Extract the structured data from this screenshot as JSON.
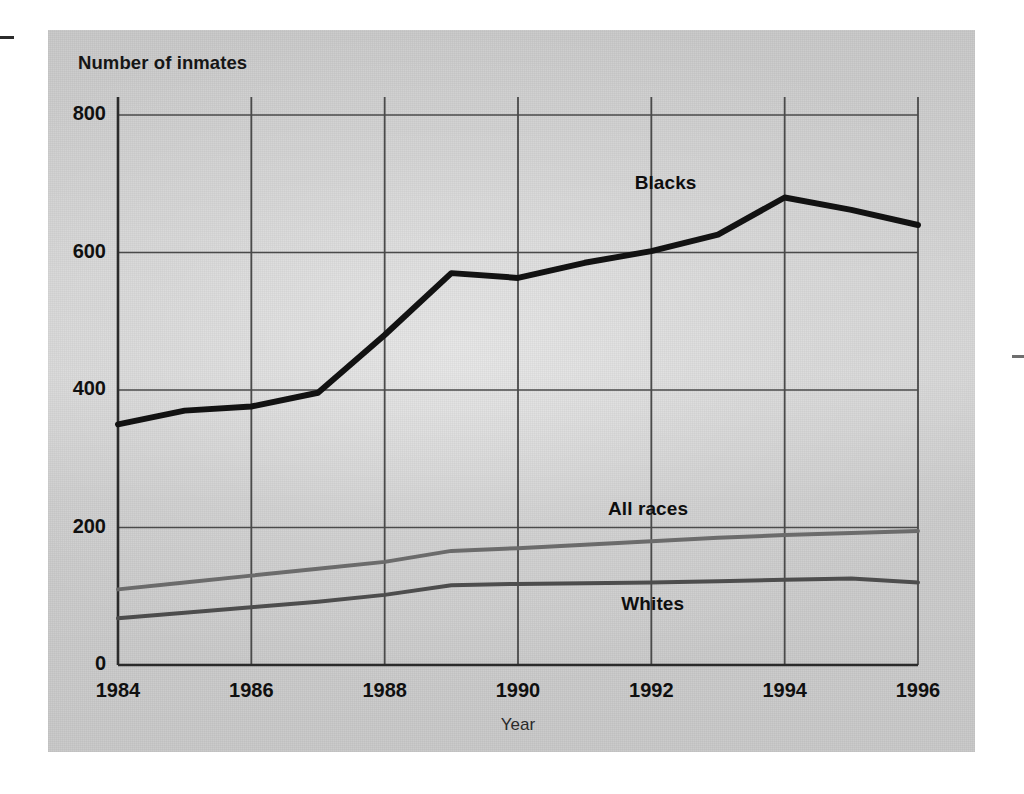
{
  "figure": {
    "y_axis_title": "Number of inmates",
    "x_axis_title": "Year",
    "panel_color": "#c9c9c9",
    "axis_color": "#2b2b2b",
    "grid_color": "#4a4a4a"
  },
  "axes": {
    "y_ticks": [
      "0",
      "200",
      "400",
      "600",
      "800"
    ],
    "x_ticks": [
      "1984",
      "1986",
      "1988",
      "1990",
      "1992",
      "1994",
      "1996"
    ]
  },
  "series_labels": {
    "blacks": "Blacks",
    "all_races": "All races",
    "whites": "Whites"
  },
  "chart_data": {
    "type": "line",
    "title": "",
    "xlabel": "Year",
    "ylabel": "Number of inmates",
    "xlim": [
      1984,
      1996
    ],
    "ylim": [
      0,
      800
    ],
    "x": [
      1984,
      1985,
      1986,
      1987,
      1988,
      1989,
      1990,
      1991,
      1992,
      1993,
      1994,
      1995,
      1996
    ],
    "y_ticks": [
      0,
      200,
      400,
      600,
      800
    ],
    "x_ticks": [
      1984,
      1986,
      1988,
      1990,
      1992,
      1994,
      1996
    ],
    "grid": true,
    "legend": "inline-labels",
    "series": [
      {
        "name": "Blacks",
        "color": "#121212",
        "width": 6,
        "values": [
          350,
          370,
          376,
          396,
          480,
          570,
          563,
          585,
          602,
          626,
          680,
          662,
          640
        ]
      },
      {
        "name": "All races",
        "color": "#6b6b6b",
        "width": 4,
        "values": [
          110,
          120,
          130,
          140,
          150,
          166,
          170,
          175,
          180,
          185,
          189,
          192,
          195
        ]
      },
      {
        "name": "Whites",
        "color": "#4d4d4d",
        "width": 4,
        "values": [
          68,
          76,
          84,
          92,
          102,
          116,
          118,
          119,
          120,
          122,
          124,
          126,
          120
        ]
      }
    ]
  },
  "annotations": [
    {
      "text": "Blacks",
      "x": 1992.5,
      "y": 700
    },
    {
      "text": "All races",
      "x": 1992.1,
      "y": 225
    },
    {
      "text": "Whites",
      "x": 1992.3,
      "y": 88
    }
  ]
}
